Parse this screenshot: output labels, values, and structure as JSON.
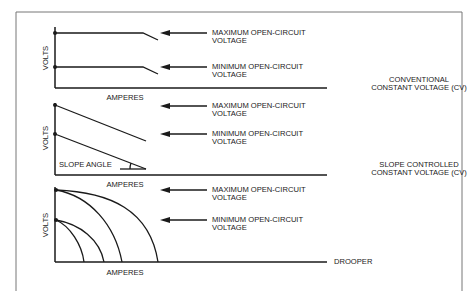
{
  "panels": [
    {
      "id": "conventional-cv",
      "y_axis_label": "VOLTS",
      "x_axis_label": "AMPERES",
      "title_line1": "CONVENTIONAL",
      "title_line2": "CONSTANT VOLTAGE (CV)",
      "arrow_labels": [
        {
          "line1": "MAXIMUM OPEN-CIRCUIT",
          "line2": "VOLTAGE"
        },
        {
          "line1": "MINIMUM OPEN-CIRCUIT",
          "line2": "VOLTAGE"
        }
      ]
    },
    {
      "id": "slope-controlled-cv",
      "y_axis_label": "VOLTS",
      "x_axis_label": "AMPERES",
      "title_line1": "SLOPE CONTROLLED",
      "title_line2": "CONSTANT VOLTAGE (CV)",
      "annotation": "SLOPE ANGLE",
      "arrow_labels": [
        {
          "line1": "MAXIMUM OPEN-CIRCUIT",
          "line2": "VOLTAGE"
        },
        {
          "line1": "MINIMUM OPEN-CIRCUIT",
          "line2": "VOLTAGE"
        }
      ]
    },
    {
      "id": "drooper",
      "y_axis_label": "VOLTS",
      "x_axis_label": "AMPERES",
      "title_line1": "DROOPER",
      "arrow_labels": [
        {
          "line1": "MAXIMUM OPEN-CIRCUIT",
          "line2": "VOLTAGE"
        },
        {
          "line1": "MINIMUM OPEN-CIRCUIT",
          "line2": "VOLTAGE"
        }
      ]
    }
  ],
  "colors": {
    "line": "#1a1a1a",
    "frame": "#777777",
    "background": "#ffffff"
  }
}
